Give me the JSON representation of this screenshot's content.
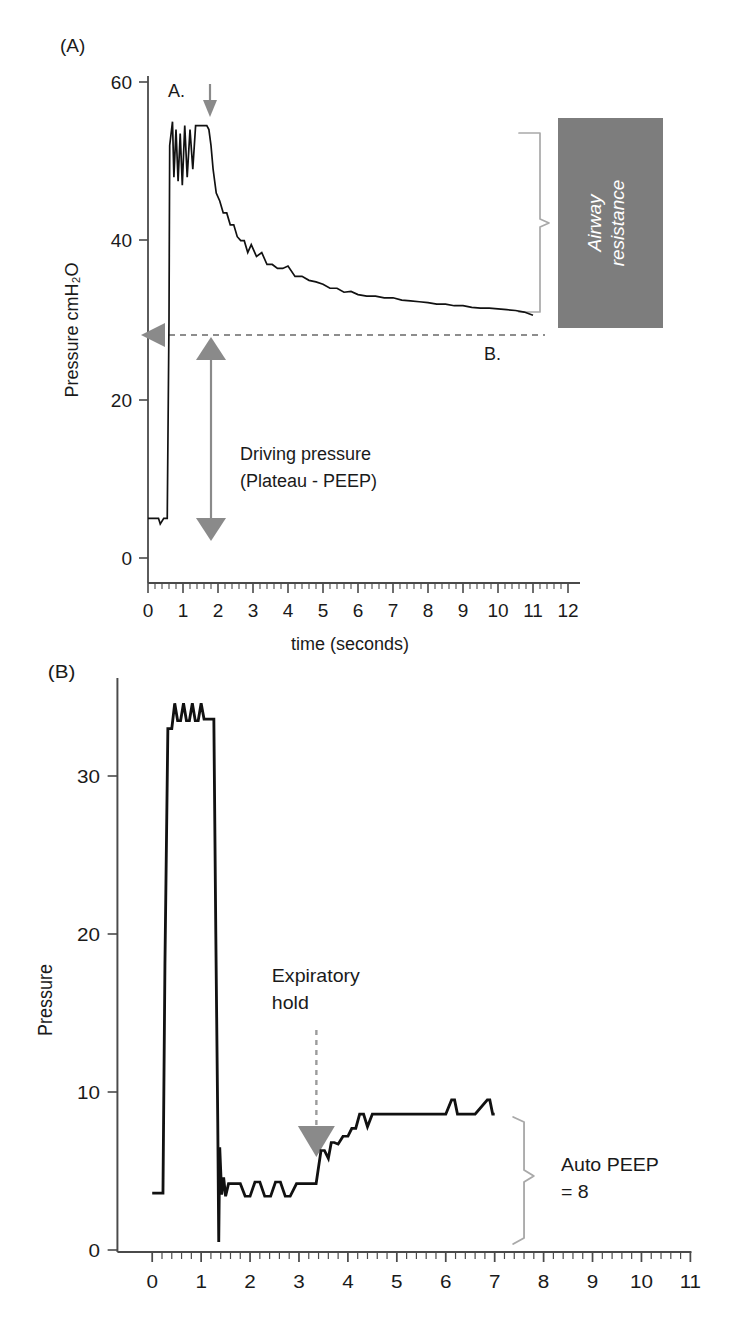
{
  "figure": {
    "panels": [
      {
        "letter": "(A)",
        "y_axis_title": "Pressure cmH₂O",
        "x_axis_title": "time (seconds)",
        "y_ticks": [
          "0",
          "20",
          "40",
          "60"
        ],
        "x_ticks": [
          "0",
          "1",
          "2",
          "3",
          "4",
          "5",
          "6",
          "7",
          "8",
          "9",
          "10",
          "11",
          "12"
        ],
        "markers": {
          "a": "A.",
          "b": "B."
        },
        "annotations": {
          "driving_line1": "Driving pressure",
          "driving_line2": "(Plateau - PEEP)",
          "airway_box_line1": "Airway",
          "airway_box_line2": "resistance"
        }
      },
      {
        "letter": "(B)",
        "y_axis_title": "Pressure",
        "x_axis_title": "",
        "y_ticks": [
          "0",
          "10",
          "20",
          "30"
        ],
        "x_ticks": [
          "0",
          "1",
          "2",
          "3",
          "4",
          "5",
          "6",
          "7",
          "8",
          "9",
          "10",
          "11"
        ],
        "annotations": {
          "exp_hold_line1": "Expiratory",
          "exp_hold_line2": "hold",
          "auto_peep_line1": "Auto PEEP",
          "auto_peep_line2": "= 8"
        }
      }
    ],
    "colors": {
      "trace": "#111111",
      "gray_accent": "#8a8a8a",
      "gray_box": "#7d7d7d",
      "bracket": "#a9a9a9",
      "axis": "#4a4a4a"
    }
  },
  "chart_data": [
    {
      "type": "line",
      "title": "(A)",
      "xlabel": "time (seconds)",
      "ylabel": "Pressure cmH2O",
      "xlim": [
        -0.35,
        12.3
      ],
      "ylim": [
        0,
        64
      ],
      "grid": false,
      "legend": "none",
      "x_ticks": [
        0,
        1,
        2,
        3,
        4,
        5,
        6,
        7,
        8,
        9,
        10,
        11,
        12
      ],
      "y_ticks": [
        0,
        20,
        40,
        60
      ],
      "minor_tick_interval": 0.2,
      "annotations": [
        {
          "text": "A.",
          "x": 0.75,
          "y": 60,
          "note": "peak inspiratory pressure marker"
        },
        {
          "text": "B.",
          "x": 10.5,
          "y": 27,
          "note": "plateau pressure marker"
        },
        {
          "text": "Driving pressure\n(Plateau - PEEP)",
          "x": 2.4,
          "y": 14,
          "note": "double-headed vertical arrow from PEEP 5 to plateau 31"
        },
        {
          "text": "Airway resistance",
          "x": 11.8,
          "y": 42,
          "note": "white italic label in gray box, bracket spans peak 55 to plateau 31"
        },
        {
          "text": "downward arrow at inspiratory hold",
          "x": 1.75,
          "y": 58
        }
      ],
      "reference_lines": [
        {
          "type": "horizontal",
          "y": 31,
          "style": "dashed",
          "color": "#8d8d8d",
          "note": "plateau pressure level with left-pointing gray triangle"
        }
      ],
      "series": [
        {
          "name": "Airway pressure",
          "description": "PEEP baseline ~5 cmH2O until 0.55 s, rapid rise to peak ~55 with 4 oscillating notches, inspiratory hold release at 1.75 s, exponential decay to plateau ~31 cmH2O with stepped noise, ends at 11 s",
          "points_x": [
            0.0,
            0.3,
            0.35,
            0.45,
            0.55,
            0.6,
            0.62,
            0.7,
            0.74,
            0.8,
            0.86,
            0.92,
            0.98,
            1.05,
            1.12,
            1.2,
            1.28,
            1.36,
            1.44,
            1.52,
            1.6,
            1.68,
            1.74,
            1.8,
            1.86,
            1.95,
            2.05,
            2.15,
            2.25,
            2.35,
            2.45,
            2.55,
            2.65,
            2.75,
            2.85,
            2.95,
            3.1,
            3.25,
            3.4,
            3.55,
            3.7,
            3.85,
            4.0,
            4.2,
            4.4,
            4.6,
            4.8,
            5.0,
            5.2,
            5.4,
            5.6,
            5.8,
            6.0,
            6.25,
            6.5,
            6.75,
            7.0,
            7.25,
            7.5,
            7.75,
            8.0,
            8.25,
            8.5,
            8.75,
            9.0,
            9.25,
            9.5,
            9.75,
            10.0,
            10.25,
            10.5,
            10.75,
            11.0
          ],
          "points_y": [
            5.0,
            5.0,
            4.3,
            5.0,
            5.0,
            30,
            52,
            55,
            48,
            54,
            47.5,
            53.5,
            47,
            54.5,
            48,
            54,
            49,
            54.5,
            54.5,
            54.5,
            54.5,
            54.5,
            54,
            52,
            49,
            46,
            45,
            43.5,
            43.5,
            42,
            42,
            40.5,
            40,
            40,
            38.5,
            39.5,
            38,
            38.5,
            37,
            37,
            36.5,
            36.5,
            36.8,
            35.5,
            35.5,
            35,
            34.8,
            34.5,
            34,
            34,
            33.5,
            33.6,
            33.2,
            33,
            33,
            32.8,
            32.8,
            32.5,
            32.4,
            32.3,
            32.2,
            32,
            32,
            31.8,
            31.8,
            31.6,
            31.5,
            31.5,
            31.4,
            31.3,
            31.2,
            31.0,
            30.6
          ]
        }
      ]
    },
    {
      "type": "line",
      "title": "(B)",
      "xlabel": "",
      "ylabel": "Pressure",
      "xlim": [
        -0.4,
        11.4
      ],
      "ylim": [
        0,
        35.5
      ],
      "grid": false,
      "legend": "none",
      "x_ticks": [
        0,
        1,
        2,
        3,
        4,
        5,
        6,
        7,
        8,
        9,
        10,
        11
      ],
      "y_ticks": [
        0,
        10,
        20,
        30
      ],
      "minor_tick_interval": 0.2,
      "annotations": [
        {
          "text": "Expiratory\nhold",
          "x": 3.1,
          "y": 16,
          "note": "dashed vertical line to gray down-triangle at 3.35 s"
        },
        {
          "text": "Auto PEEP\n= 8",
          "x": 8.3,
          "y": 4.5,
          "note": "right curly bracket spanning 0 to 8.5 cmH2O at ~7.6 s"
        }
      ],
      "series": [
        {
          "name": "Airway pressure",
          "description": "PEEP baseline ~3.6, square inspiratory plateau ~34 with notches from 0.3 to 1.3 s, drop with undershoot to 0.5, expiratory baseline ~4, expiratory hold at 3.35 s, pressure rises to auto-PEEP plateau ~8.6 with brief spikes, ends at 7 s",
          "points_x": [
            0.0,
            0.22,
            0.26,
            0.32,
            0.4,
            0.46,
            0.52,
            0.58,
            0.64,
            0.7,
            0.76,
            0.82,
            0.88,
            0.94,
            1.0,
            1.06,
            1.12,
            1.18,
            1.26,
            1.3,
            1.34,
            1.36,
            1.38,
            1.42,
            1.46,
            1.5,
            1.56,
            1.62,
            1.7,
            1.8,
            1.9,
            2.0,
            2.1,
            2.2,
            2.3,
            2.42,
            2.52,
            2.62,
            2.72,
            2.82,
            2.95,
            3.1,
            3.25,
            3.35,
            3.45,
            3.52,
            3.6,
            3.66,
            3.72,
            3.8,
            3.9,
            4.0,
            4.08,
            4.16,
            4.24,
            4.32,
            4.4,
            4.5,
            5.0,
            5.5,
            6.0,
            6.12,
            6.18,
            6.24,
            6.3,
            6.6,
            6.85,
            6.9,
            6.96,
            7.0
          ],
          "points_y": [
            3.6,
            3.6,
            18,
            33,
            33,
            34.6,
            33.5,
            33.5,
            34.6,
            33.5,
            33.5,
            34.6,
            33.5,
            33.5,
            34.6,
            33.6,
            33.6,
            33.6,
            33.6,
            20,
            8,
            0.5,
            6.5,
            3.5,
            4.6,
            3.4,
            4.2,
            4.2,
            4.2,
            4.2,
            3.4,
            3.4,
            4.3,
            4.3,
            3.4,
            3.4,
            4.3,
            4.3,
            3.4,
            3.4,
            4.2,
            4.2,
            4.2,
            4.2,
            6.3,
            6.3,
            5.8,
            6.8,
            6.8,
            6.7,
            7.2,
            7.2,
            7.7,
            7.7,
            8.6,
            8.6,
            7.8,
            8.6,
            8.6,
            8.6,
            8.6,
            9.5,
            9.5,
            8.6,
            8.6,
            8.6,
            9.5,
            9.5,
            8.6,
            8.6
          ]
        }
      ]
    }
  ]
}
